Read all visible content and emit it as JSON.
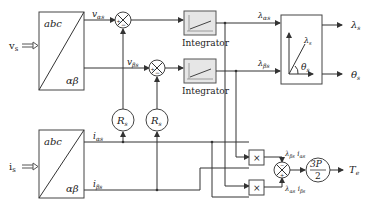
{
  "diagram": {
    "inputs": {
      "voltage": "v",
      "voltage_sub": "s",
      "current": "i",
      "current_sub": "s"
    },
    "transform_blocks": [
      {
        "top_label": "abc",
        "bottom_label": "αβ"
      },
      {
        "top_label": "abc",
        "bottom_label": "αβ"
      }
    ],
    "signals": {
      "v_alpha": "v",
      "v_alpha_sub": "αs",
      "v_beta": "v",
      "v_beta_sub": "βs",
      "i_alpha": "i",
      "i_alpha_sub": "αs",
      "i_beta": "i",
      "i_beta_sub": "βs",
      "lambda_alpha": "λ",
      "lambda_alpha_sub": "αs",
      "lambda_beta": "λ",
      "lambda_beta_sub": "βs"
    },
    "summing_junctions": [
      {
        "plus": "+",
        "minus": "−"
      },
      {
        "plus": "+",
        "minus": "−"
      },
      {
        "plus": "+",
        "minus": "−"
      }
    ],
    "resistors": [
      {
        "label": "R",
        "sub": "s"
      },
      {
        "label": "R",
        "sub": "s"
      }
    ],
    "integrators": [
      {
        "label": "Integrator"
      },
      {
        "label": "Integrator"
      }
    ],
    "polar_block": {
      "vector_label": "λ",
      "vector_sub": "s",
      "angle_label": "θ",
      "angle_sub": "s"
    },
    "outputs": {
      "flux": "λ",
      "flux_sub": "s",
      "angle": "θ",
      "angle_sub": "s",
      "torque": "T",
      "torque_sub": "e"
    },
    "multipliers": [
      {
        "symbol": "×"
      },
      {
        "symbol": "×"
      }
    ],
    "products": {
      "top_a": "λ",
      "top_a_sub": "βs",
      "top_b": "i",
      "top_b_sub": "αs",
      "bot_a": "λ",
      "bot_a_sub": "αs",
      "bot_b": "i",
      "bot_b_sub": "βs"
    },
    "gain": {
      "numerator": "3P",
      "denominator": "2"
    }
  }
}
